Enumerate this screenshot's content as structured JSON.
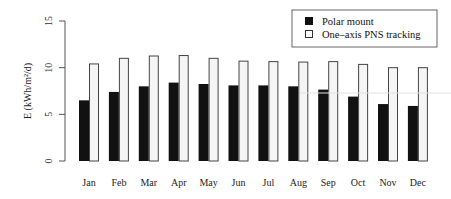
{
  "chart_data": {
    "type": "bar",
    "title": "",
    "xlabel": "",
    "ylabel": "E (kWh/m2/d)",
    "ylabel_display": "E (kWh/m²/d)",
    "ylim": [
      0,
      15
    ],
    "yticks": [
      0,
      5,
      10,
      15
    ],
    "grid": false,
    "legend_position": "top-right",
    "categories": [
      "Jan",
      "Feb",
      "Mar",
      "Apr",
      "May",
      "Jun",
      "Jul",
      "Aug",
      "Sep",
      "Oct",
      "Nov",
      "Dec"
    ],
    "series": [
      {
        "name": "Polar mount",
        "color": "#111111",
        "values": [
          6.5,
          7.4,
          8.0,
          8.4,
          8.25,
          8.1,
          8.1,
          8.0,
          7.65,
          6.9,
          6.1,
          5.9
        ]
      },
      {
        "name": "One-axis PNS tracking",
        "color": "#f5f5f5",
        "values": [
          10.4,
          11.0,
          11.25,
          11.3,
          11.0,
          10.7,
          10.65,
          10.6,
          10.65,
          10.35,
          10.0,
          10.0
        ]
      }
    ]
  },
  "legend": {
    "items": [
      {
        "label": "Polar mount"
      },
      {
        "label": "One–axis PNS tracking"
      }
    ]
  },
  "axis": {
    "ylabel": "E (kWh/m²/d)"
  }
}
